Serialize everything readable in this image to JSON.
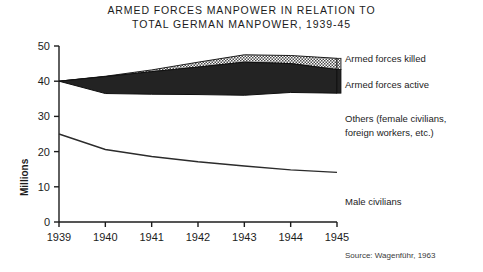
{
  "title": {
    "line1": "ARMED  FORCES  MANPOWER IN RELATION TO",
    "line2": "TOTAL  GERMAN  MANPOWER, 1939-45"
  },
  "source": "Source: Wagenführ, 1963",
  "annotations": {
    "killed": "Armed forces killed",
    "active": "Armed forces active",
    "others_line1": "Others (female civilians,",
    "others_line2": "foreign workers, etc.)",
    "male": "Male civilians"
  },
  "colors": {
    "active_fill": "#232323",
    "killed_fill": "#d8d8d8",
    "line": "#2b2b2b",
    "axis": "#1c1c1c",
    "background": "#ffffff"
  },
  "chart_data": {
    "type": "area",
    "title": "ARMED FORCES MANPOWER IN RELATION TO TOTAL GERMAN MANPOWER, 1939-45",
    "xlabel": "",
    "ylabel": "Millions",
    "xlim": [
      1939,
      1945
    ],
    "ylim": [
      0,
      50
    ],
    "grid": false,
    "legend": "right-inline-labels",
    "x": [
      1939,
      1940,
      1941,
      1942,
      1943,
      1944,
      1945
    ],
    "xticklabels": [
      "1939",
      "1940",
      "1941",
      "1942",
      "1943",
      "1944",
      "1945"
    ],
    "yticks": [
      0,
      10,
      20,
      30,
      40,
      50
    ],
    "yticklabels": [
      "0",
      "10",
      "20",
      "30",
      "40",
      "50"
    ],
    "series": [
      {
        "name": "Armed forces active",
        "kind": "band",
        "fill": "#232323",
        "lower": [
          40.0,
          36.5,
          36.3,
          36.2,
          36.0,
          36.8,
          36.6
        ],
        "upper": [
          40.0,
          41.3,
          42.7,
          44.0,
          45.4,
          45.0,
          43.3
        ]
      },
      {
        "name": "Armed forces killed",
        "kind": "band",
        "fill": "#d8d8d8",
        "lower": [
          40.0,
          41.3,
          42.7,
          44.0,
          45.4,
          45.0,
          43.3
        ],
        "upper": [
          40.0,
          41.4,
          43.2,
          45.4,
          47.5,
          47.3,
          46.5
        ]
      },
      {
        "name": "Male civilians",
        "kind": "line",
        "color": "#2b2b2b",
        "values": [
          25.0,
          20.6,
          18.6,
          17.1,
          15.9,
          14.8,
          14.1
        ]
      }
    ],
    "notes": [
      "Area above the killed band up to total German manpower represents Others (female civilians, foreign workers, etc.)",
      "Area below the Male civilians line is Male civilians"
    ]
  }
}
